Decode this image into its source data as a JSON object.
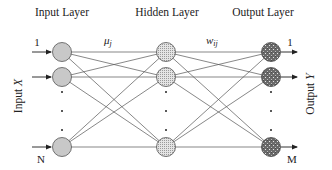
{
  "figure": {
    "type": "feedforward-neural-network",
    "colors": {
      "background": "#ffffff",
      "input_node_fill": "#c8c8c8",
      "hidden_node_fill": "#dcdcdc",
      "output_node_fill": "#6e6e6e",
      "edge": "#555555",
      "text": "#222222"
    },
    "layers": [
      {
        "title": "Input Layer",
        "top_index": "1",
        "bottom_index": "N",
        "node_style": "solid-gray"
      },
      {
        "title": "Hidden Layer",
        "node_style": "fine-dotted-light"
      },
      {
        "title": "Output Layer",
        "top_index": "1",
        "bottom_index": "M",
        "node_style": "speckled-dark"
      }
    ],
    "weights": {
      "input_to_hidden": "μ",
      "input_to_hidden_sub": "j",
      "hidden_to_output": "w",
      "hidden_to_output_sub": "ij"
    },
    "side_labels": {
      "input": "Input",
      "input_var": "X",
      "output": "Output",
      "output_var": "Y"
    }
  }
}
